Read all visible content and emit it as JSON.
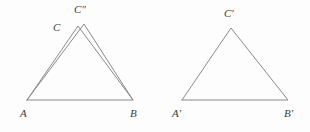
{
  "figure": {
    "background_color": "#fdfdfd",
    "stroke_color": "#8a8a8a",
    "label_color": "#3c3c3c",
    "width": 310,
    "height": 132,
    "left_shape": {
      "name": "sheared-triangle-pair",
      "base_vertices": {
        "A": {
          "x": 27,
          "y": 100
        },
        "B": {
          "x": 133,
          "y": 100
        }
      },
      "apexes": {
        "C": {
          "x": 78,
          "y": 26
        },
        "C_double_prime": {
          "x": 84,
          "y": 24
        }
      },
      "polylines": [
        "27,100 78,26 133,100 27,100",
        "27,100 84,24 133,100"
      ]
    },
    "right_shape": {
      "name": "congruent-triangle",
      "vertices": {
        "A_prime": {
          "x": 182,
          "y": 100
        },
        "B_prime": {
          "x": 288,
          "y": 100
        },
        "C_prime": {
          "x": 231,
          "y": 28
        }
      },
      "polylines": [
        "182,100 231,28 288,100 182,100"
      ]
    },
    "labels": [
      {
        "id": "label-C-double-prime",
        "base": "C",
        "primes": "″",
        "text": "C″",
        "x": 74,
        "y": 4
      },
      {
        "id": "label-C",
        "base": "C",
        "primes": "",
        "text": "C",
        "x": 53,
        "y": 22
      },
      {
        "id": "label-A",
        "base": "A",
        "primes": "",
        "text": "A",
        "x": 20,
        "y": 108
      },
      {
        "id": "label-B",
        "base": "B",
        "primes": "",
        "text": "B",
        "x": 130,
        "y": 108
      },
      {
        "id": "label-C-prime",
        "base": "C",
        "primes": "′",
        "text": "C′",
        "x": 224,
        "y": 8
      },
      {
        "id": "label-A-prime",
        "base": "A",
        "primes": "′",
        "text": "A′",
        "x": 172,
        "y": 108
      },
      {
        "id": "label-B-prime",
        "base": "B",
        "primes": "′",
        "text": "B′",
        "x": 284,
        "y": 108
      }
    ]
  }
}
